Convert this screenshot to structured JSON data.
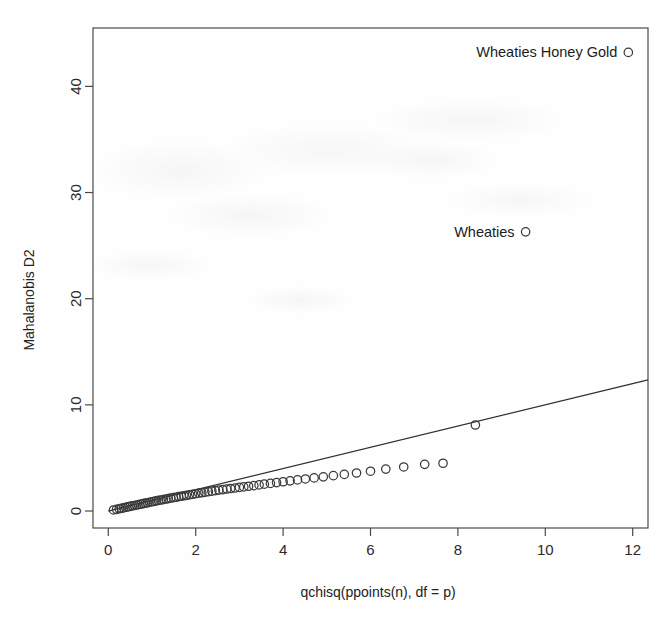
{
  "chart_data": {
    "type": "scatter",
    "title": "",
    "xlabel": "qchisq(ppoints(n), df = p)",
    "ylabel": "Mahalanobis D2",
    "xlim": [
      -0.35,
      12.35
    ],
    "ylim": [
      -1.6,
      45.5
    ],
    "xticks": [
      0,
      2,
      4,
      6,
      8,
      10,
      12
    ],
    "yticks": [
      0,
      10,
      20,
      30,
      40
    ],
    "xtick_labels": [
      "0",
      "2",
      "4",
      "6",
      "8",
      "10",
      "12"
    ],
    "ytick_labels": [
      "0",
      "10",
      "20",
      "30",
      "40"
    ],
    "grid": false,
    "legend": "none",
    "marker": "open-circle",
    "reference_line": {
      "description": "y = x identity reference line",
      "x": [
        0.0,
        12.35
      ],
      "y": [
        0.0,
        12.35
      ],
      "slope": 1.0,
      "intercept": 0.0
    },
    "x": [
      0.12,
      0.19,
      0.25,
      0.3,
      0.35,
      0.4,
      0.45,
      0.5,
      0.55,
      0.6,
      0.65,
      0.7,
      0.75,
      0.8,
      0.85,
      0.9,
      0.95,
      1.0,
      1.05,
      1.1,
      1.15,
      1.21,
      1.26,
      1.32,
      1.37,
      1.43,
      1.49,
      1.55,
      1.61,
      1.67,
      1.73,
      1.79,
      1.86,
      1.93,
      2.0,
      2.07,
      2.14,
      2.21,
      2.29,
      2.37,
      2.45,
      2.53,
      2.62,
      2.71,
      2.8,
      2.9,
      3.0,
      3.1,
      3.21,
      3.33,
      3.45,
      3.57,
      3.71,
      3.85,
      4.0,
      4.16,
      4.33,
      4.51,
      4.71,
      4.92,
      5.15,
      5.4,
      5.68,
      6.0,
      6.35,
      6.76,
      7.24,
      7.66,
      8.4,
      9.55,
      11.9
    ],
    "y": [
      0.1,
      0.16,
      0.21,
      0.26,
      0.3,
      0.35,
      0.39,
      0.44,
      0.48,
      0.52,
      0.57,
      0.61,
      0.65,
      0.7,
      0.74,
      0.78,
      0.83,
      0.87,
      0.91,
      0.95,
      1.0,
      1.04,
      1.08,
      1.13,
      1.17,
      1.21,
      1.26,
      1.3,
      1.35,
      1.39,
      1.44,
      1.48,
      1.53,
      1.58,
      1.63,
      1.68,
      1.72,
      1.77,
      1.82,
      1.87,
      1.92,
      1.97,
      2.02,
      2.07,
      2.12,
      2.17,
      2.22,
      2.27,
      2.33,
      2.39,
      2.46,
      2.53,
      2.6,
      2.68,
      2.76,
      2.84,
      2.93,
      3.02,
      3.12,
      3.22,
      3.33,
      3.45,
      3.58,
      3.75,
      3.95,
      4.15,
      4.4,
      4.5,
      8.1,
      26.3,
      43.2
    ],
    "annotations": [
      {
        "label": "Wheaties Honey Gold",
        "x": 11.9,
        "y": 43.2
      },
      {
        "label": "Wheaties",
        "x": 9.55,
        "y": 26.3
      }
    ]
  }
}
